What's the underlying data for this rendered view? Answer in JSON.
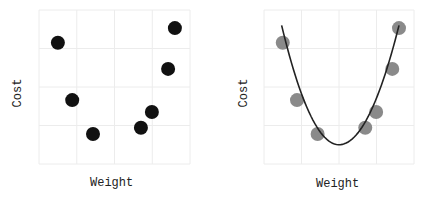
{
  "chart_data": [
    {
      "type": "scatter",
      "title": "",
      "xlabel": "Weight",
      "ylabel": "Cost",
      "xlim": [
        0,
        4
      ],
      "ylim": [
        0,
        4
      ],
      "grid": true,
      "ticks_shown": false,
      "marker_color": "#111111",
      "points": [
        {
          "x": 0.5,
          "y": 3.15
        },
        {
          "x": 0.88,
          "y": 1.66
        },
        {
          "x": 1.43,
          "y": 0.78
        },
        {
          "x": 2.7,
          "y": 0.94
        },
        {
          "x": 2.99,
          "y": 1.35
        },
        {
          "x": 3.42,
          "y": 2.47
        },
        {
          "x": 3.6,
          "y": 3.53
        }
      ]
    },
    {
      "type": "scatter",
      "title": "",
      "xlabel": "Weight",
      "ylabel": "Cost",
      "xlim": [
        0,
        4
      ],
      "ylim": [
        0,
        4
      ],
      "grid": true,
      "ticks_shown": false,
      "marker_color": "#8a8a8a",
      "line_color": "#222222",
      "points": [
        {
          "x": 0.5,
          "y": 3.15
        },
        {
          "x": 0.88,
          "y": 1.66
        },
        {
          "x": 1.43,
          "y": 0.78
        },
        {
          "x": 2.7,
          "y": 0.94
        },
        {
          "x": 2.99,
          "y": 1.35
        },
        {
          "x": 3.42,
          "y": 2.47
        },
        {
          "x": 3.6,
          "y": 3.53
        }
      ],
      "fit_curve": {
        "kind": "quadratic",
        "x_range": [
          0.47,
          3.6
        ],
        "vertex": {
          "x": 2.0,
          "y": 0.5
        },
        "endpoints": [
          {
            "x": 0.47,
            "y": 3.6
          },
          {
            "x": 3.6,
            "y": 3.6
          }
        ]
      }
    }
  ],
  "left_panel": {
    "xlabel": "Weight",
    "ylabel": "Cost"
  },
  "right_panel": {
    "xlabel": "Weight",
    "ylabel": "Cost"
  }
}
